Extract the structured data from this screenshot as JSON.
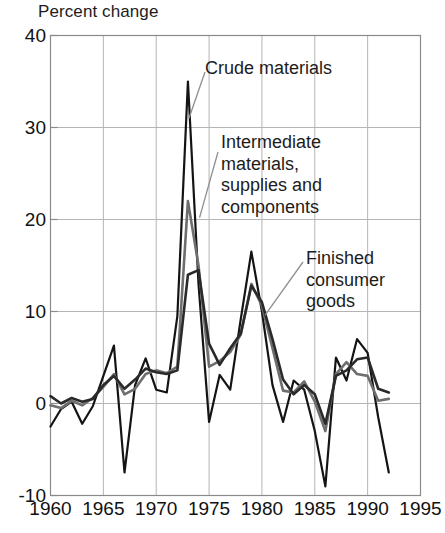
{
  "chart_data": {
    "type": "line",
    "title": "Percent change",
    "xlabel": "",
    "ylabel": "Percent change",
    "xlim": [
      1960,
      1995
    ],
    "ylim": [
      -10,
      40
    ],
    "xticks": [
      1960,
      1965,
      1970,
      1975,
      1980,
      1985,
      1990,
      1995
    ],
    "yticks": [
      -10,
      0,
      10,
      20,
      30,
      40
    ],
    "grid": true,
    "legend_position": "inline-annotations",
    "x": [
      1960,
      1961,
      1962,
      1963,
      1964,
      1965,
      1966,
      1967,
      1968,
      1969,
      1970,
      1971,
      1972,
      1973,
      1974,
      1975,
      1976,
      1977,
      1978,
      1979,
      1980,
      1981,
      1982,
      1983,
      1984,
      1985,
      1986,
      1987,
      1988,
      1989,
      1990,
      1991,
      1992
    ],
    "series": [
      {
        "name": "Crude materials",
        "color": "#141414",
        "width": 2.2,
        "values": [
          -2.5,
          -0.6,
          0.2,
          -2.2,
          -0.3,
          3.0,
          6.3,
          -7.5,
          2.0,
          4.9,
          1.5,
          1.2,
          9.5,
          35.0,
          13.0,
          -2.0,
          3.1,
          1.5,
          9.2,
          16.5,
          10.0,
          2.0,
          -2.0,
          2.5,
          1.5,
          -3.0,
          -9.0,
          5.0,
          2.5,
          7.0,
          5.5,
          -1.5,
          -7.5
        ]
      },
      {
        "name": "Intermediate materials, supplies and components",
        "color": "#6e6e6e",
        "width": 2.6,
        "values": [
          -0.2,
          -0.5,
          0.3,
          -0.2,
          0.6,
          1.8,
          3.2,
          1.0,
          1.6,
          3.2,
          3.6,
          3.3,
          4.0,
          22.0,
          15.0,
          4.0,
          4.6,
          5.6,
          7.5,
          13.0,
          10.6,
          6.0,
          1.4,
          1.2,
          2.4,
          0.2,
          -3.0,
          3.2,
          4.5,
          3.2,
          3.0,
          0.3,
          0.5
        ]
      },
      {
        "name": "Finished consumer goods",
        "color": "#2a2a2a",
        "width": 2.6,
        "values": [
          0.8,
          0.0,
          0.6,
          0.2,
          0.5,
          2.0,
          3.0,
          1.6,
          2.6,
          3.8,
          3.4,
          3.2,
          3.6,
          14.0,
          14.5,
          6.5,
          4.2,
          6.0,
          7.6,
          12.8,
          11.0,
          7.0,
          2.6,
          1.0,
          2.0,
          1.0,
          -2.2,
          3.0,
          3.6,
          4.8,
          5.0,
          1.6,
          1.2
        ]
      }
    ],
    "annotations": [
      {
        "id": "crude",
        "lines": [
          "Crude materials"
        ],
        "target_x": 1973.1,
        "target_y": 31.0
      },
      {
        "id": "intermediate",
        "lines": [
          "Intermediate",
          "materials,",
          "supplies and",
          "components"
        ],
        "target_x": 1974.1,
        "target_y": 20.2
      },
      {
        "id": "finished",
        "lines": [
          "Finished",
          "consumer",
          "goods"
        ],
        "target_x": 1980.3,
        "target_y": 9.6
      }
    ]
  },
  "colors": {
    "axis": "#8a8a8a",
    "grid": "#b4b4b4",
    "text": "#111111",
    "background": "#ffffff",
    "leader": "#8f8f8f"
  }
}
